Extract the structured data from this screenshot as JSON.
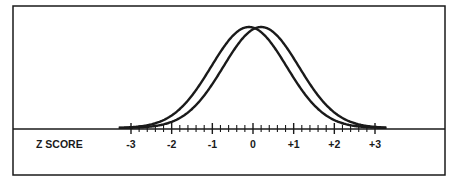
{
  "figure": {
    "axis_label": "Z SCORE",
    "tick_labels": [
      "-3",
      "-2",
      "-1",
      "0",
      "+1",
      "+2",
      "+3"
    ],
    "colors": {
      "ink": "#1a1a1a",
      "background": "#ffffff"
    }
  },
  "chart_data": {
    "type": "line",
    "title": "",
    "xlabel": "Z SCORE",
    "ylabel": "",
    "xlim": [
      -3,
      3
    ],
    "x_ticks_major": [
      -3,
      -2,
      -1,
      0,
      1,
      2,
      3
    ],
    "x_tick_labels": [
      "-3",
      "-2",
      "-1",
      "0",
      "+1",
      "+2",
      "+3"
    ],
    "x_ticks_minor_step": 0.2,
    "grid": false,
    "legend": null,
    "series": [
      {
        "name": "Distribution A (normal curve, shifted left)",
        "mean": -0.1,
        "sd": 1.0
      },
      {
        "name": "Distribution B (normal curve, shifted right)",
        "mean": 0.2,
        "sd": 1.0
      }
    ]
  }
}
